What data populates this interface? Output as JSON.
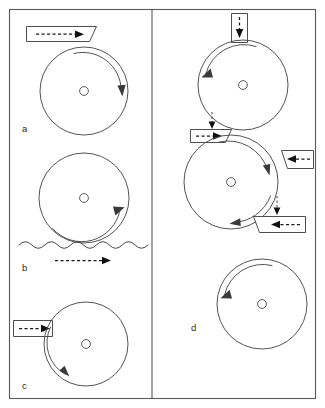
{
  "figure": {
    "background_color": "#ffffff",
    "line_color": "#3c3c3c",
    "frame_color": "#5a5a5a",
    "width": 325,
    "height": 408,
    "panels": [
      {
        "id": "a",
        "label": "a",
        "label_x": 22,
        "label_y": 132,
        "description": "Wheel driven by a belt passing over the top; belt arrow points right, wheel rotates clockwise",
        "wheel": {
          "cx": 84,
          "cy": 91,
          "r": 44,
          "hub_r": 4.4
        },
        "rotation": "clockwise",
        "band": {
          "type": "parallelogram-top",
          "arrow_direction": "right",
          "arrow_style": "dashed"
        }
      },
      {
        "id": "b",
        "label": "b",
        "label_x": 22,
        "label_y": 271,
        "description": "Wheel rolling on a wavy (compliant) surface; motion arrow points right below the surface, wheel rotates clockwise",
        "wheel": {
          "cx": 84,
          "cy": 198,
          "r": 45,
          "hub_r": 4.4
        },
        "rotation": "clockwise",
        "surface": {
          "type": "wavy",
          "x_start": 19,
          "x_end": 148,
          "y": 245,
          "peaks": 10
        },
        "band": {
          "type": "free-arrow",
          "arrow_direction": "right",
          "arrow_style": "dashed"
        }
      },
      {
        "id": "c",
        "label": "c",
        "label_x": 22,
        "label_y": 389,
        "description": "Wheel driven by a belt entering horizontally from the left at mid-height; wheel rotates counter-clockwise",
        "wheel": {
          "cx": 86,
          "cy": 344,
          "r": 42,
          "hub_r": 4.4
        },
        "rotation": "counter-clockwise",
        "band": {
          "type": "rectangle-left",
          "arrow_direction": "right",
          "arrow_style": "dashed"
        }
      },
      {
        "id": "d",
        "label": "d",
        "label_x": 191,
        "label_y": 331,
        "description": "Three stacked wheels in a train; belts enter from top and from the right, arrows show transfer of motion between wheels",
        "wheels": [
          {
            "cx": 243,
            "cy": 85,
            "r": 45,
            "hub_r": 4.4,
            "rotation": "counter-clockwise"
          },
          {
            "cx": 231,
            "cy": 182,
            "r": 47,
            "hub_r": 4.4,
            "rotation": "clockwise"
          },
          {
            "cx": 262,
            "cy": 304,
            "r": 45,
            "hub_r": 4.4,
            "rotation": "counter-clockwise"
          }
        ],
        "bands": [
          {
            "type": "vertical-top",
            "arrow_direction": "down",
            "arrow_style": "dashed"
          },
          {
            "type": "horizontal-left-mid",
            "arrow_direction": "right",
            "arrow_style": "dashed"
          },
          {
            "type": "slanted-right-upper",
            "arrow_direction": "left",
            "arrow_style": "dashed"
          },
          {
            "type": "slanted-right-lower",
            "arrow_direction": "left",
            "arrow_style": "dashed"
          }
        ],
        "connector_arrows": [
          {
            "direction": "down",
            "style": "dashed-thin"
          },
          {
            "direction": "down",
            "style": "dashed-thin"
          }
        ]
      }
    ]
  }
}
